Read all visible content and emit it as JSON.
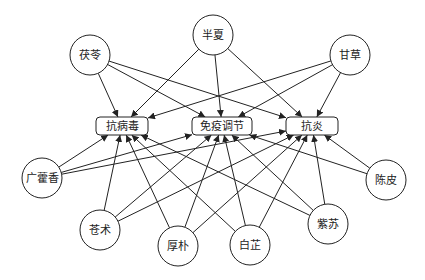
{
  "diagram": {
    "type": "network",
    "herbs": [
      {
        "id": "fuling",
        "label": "茯苓",
        "x": 90,
        "y": 55,
        "r": 20
      },
      {
        "id": "banxia",
        "label": "半夏",
        "x": 213,
        "y": 35,
        "r": 20
      },
      {
        "id": "gancao",
        "label": "甘草",
        "x": 350,
        "y": 55,
        "r": 20
      },
      {
        "id": "guanghuoxiang",
        "label": "广藿香",
        "x": 42,
        "y": 178,
        "r": 20
      },
      {
        "id": "chenpi",
        "label": "陈皮",
        "x": 386,
        "y": 180,
        "r": 20
      },
      {
        "id": "cangzhu",
        "label": "苍术",
        "x": 100,
        "y": 230,
        "r": 20
      },
      {
        "id": "houpo",
        "label": "厚朴",
        "x": 178,
        "y": 246,
        "r": 20
      },
      {
        "id": "baizhi",
        "label": "白芷",
        "x": 250,
        "y": 245,
        "r": 20
      },
      {
        "id": "zisu",
        "label": "紫苏",
        "x": 328,
        "y": 224,
        "r": 20
      }
    ],
    "effects": [
      {
        "id": "antiviral",
        "label": "抗病毒",
        "x": 122,
        "y": 126,
        "w": 52,
        "h": 18
      },
      {
        "id": "immune",
        "label": "免疫调节",
        "x": 222,
        "y": 126,
        "w": 60,
        "h": 18
      },
      {
        "id": "antiinflam",
        "label": "抗炎",
        "x": 312,
        "y": 126,
        "w": 52,
        "h": 18
      }
    ],
    "edges": [
      [
        "fuling",
        "antiviral"
      ],
      [
        "fuling",
        "immune"
      ],
      [
        "fuling",
        "antiinflam"
      ],
      [
        "banxia",
        "antiviral"
      ],
      [
        "banxia",
        "immune"
      ],
      [
        "banxia",
        "antiinflam"
      ],
      [
        "gancao",
        "antiviral"
      ],
      [
        "gancao",
        "immune"
      ],
      [
        "gancao",
        "antiinflam"
      ],
      [
        "guanghuoxiang",
        "antiviral"
      ],
      [
        "guanghuoxiang",
        "immune"
      ],
      [
        "guanghuoxiang",
        "antiinflam"
      ],
      [
        "cangzhu",
        "antiviral"
      ],
      [
        "cangzhu",
        "immune"
      ],
      [
        "cangzhu",
        "antiinflam"
      ],
      [
        "houpo",
        "antiviral"
      ],
      [
        "houpo",
        "immune"
      ],
      [
        "houpo",
        "antiinflam"
      ],
      [
        "baizhi",
        "antiviral"
      ],
      [
        "baizhi",
        "immune"
      ],
      [
        "baizhi",
        "antiinflam"
      ],
      [
        "zisu",
        "antiviral"
      ],
      [
        "zisu",
        "immune"
      ],
      [
        "zisu",
        "antiinflam"
      ],
      [
        "chenpi",
        "immune"
      ],
      [
        "chenpi",
        "antiinflam"
      ]
    ]
  }
}
